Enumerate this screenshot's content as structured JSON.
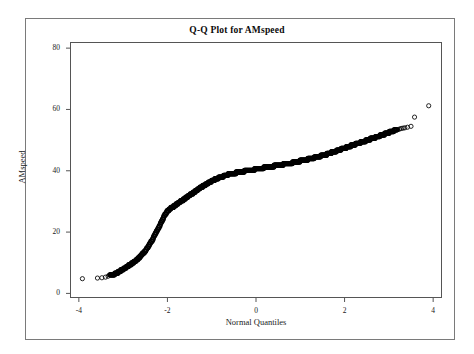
{
  "figure": {
    "title": "Q-Q Plot for AMspeed",
    "background_color": "#ffffff",
    "frame_color": "#7a7a7a",
    "axis_color": "#555555",
    "marker_color": "#000000"
  },
  "axes": {
    "x": {
      "label": "Normal Quantiles",
      "ticks": [
        "-4",
        "-2",
        "0",
        "2",
        "4"
      ],
      "tick_values": [
        -4,
        -2,
        0,
        2,
        4
      ],
      "range": [
        -4.2,
        4.2
      ]
    },
    "y": {
      "label": "AMspeed",
      "ticks": [
        "0",
        "20",
        "40",
        "60",
        "80"
      ],
      "tick_values": [
        0,
        20,
        40,
        60,
        80
      ],
      "range": [
        -1.5,
        82
      ]
    }
  },
  "chart_data": {
    "type": "scatter",
    "title": "Q-Q Plot for AMspeed",
    "xlabel": "Normal Quantiles",
    "ylabel": "AMspeed",
    "xlim": [
      -4.2,
      4.2
    ],
    "ylim": [
      -1.5,
      82
    ],
    "grid": false,
    "legend": null,
    "marker": "open-circle",
    "series": [
      {
        "name": "AMspeed sample quantiles",
        "x": [
          -3.92,
          -3.58,
          -3.48,
          -3.4,
          -3.34,
          -3.29,
          -3.24,
          -3.19,
          -3.15,
          -3.11,
          -3.07,
          -3.03,
          -3.0,
          -2.96,
          -2.93,
          -2.9,
          -2.87,
          -2.84,
          -2.81,
          -2.78,
          -2.75,
          -2.72,
          -2.7,
          -2.67,
          -2.64,
          -2.62,
          -2.59,
          -2.57,
          -2.54,
          -2.52,
          -2.49,
          -2.47,
          -2.45,
          -2.42,
          -2.4,
          -2.38,
          -2.35,
          -2.33,
          -2.31,
          -2.29,
          -2.27,
          -2.24,
          -2.22,
          -2.2,
          -2.18,
          -2.16,
          -2.14,
          -2.12,
          -2.1,
          -2.08,
          -2.06,
          -2.04,
          -2.02,
          -2.0,
          -1.98,
          -1.96,
          -1.94,
          -1.92,
          -1.9,
          -1.88,
          -1.86,
          -1.84,
          -1.82,
          -1.8,
          -1.78,
          -1.76,
          -1.74,
          -1.72,
          -1.7,
          -1.68,
          -1.66,
          -1.64,
          -1.62,
          -1.6,
          -1.58,
          -1.56,
          -1.54,
          -1.52,
          -1.5,
          -1.48,
          -1.46,
          -1.44,
          -1.42,
          -1.4,
          -1.38,
          -1.36,
          -1.34,
          -1.32,
          -1.3,
          -1.28,
          -1.26,
          -1.24,
          -1.22,
          -1.2,
          -1.18,
          -1.16,
          -1.14,
          -1.12,
          -1.1,
          -1.08,
          -1.06,
          -1.04,
          -1.02,
          -1.0,
          -0.98,
          -0.96,
          -0.94,
          -0.92,
          -0.9,
          -0.88,
          -0.86,
          -0.84,
          -0.82,
          -0.8,
          -0.78,
          -0.76,
          -0.74,
          -0.72,
          -0.7,
          -0.68,
          -0.66,
          -0.64,
          -0.62,
          -0.6,
          -0.58,
          -0.56,
          -0.54,
          -0.52,
          -0.5,
          -0.48,
          -0.46,
          -0.44,
          -0.42,
          -0.4,
          -0.38,
          -0.36,
          -0.34,
          -0.32,
          -0.3,
          -0.28,
          -0.26,
          -0.24,
          -0.22,
          -0.2,
          -0.18,
          -0.16,
          -0.14,
          -0.12,
          -0.1,
          -0.08,
          -0.06,
          -0.04,
          -0.02,
          0.0,
          0.02,
          0.04,
          0.06,
          0.08,
          0.1,
          0.12,
          0.14,
          0.16,
          0.18,
          0.2,
          0.22,
          0.24,
          0.26,
          0.28,
          0.3,
          0.32,
          0.34,
          0.36,
          0.38,
          0.4,
          0.42,
          0.44,
          0.46,
          0.48,
          0.5,
          0.52,
          0.54,
          0.56,
          0.58,
          0.6,
          0.62,
          0.64,
          0.66,
          0.68,
          0.7,
          0.72,
          0.74,
          0.76,
          0.78,
          0.8,
          0.82,
          0.84,
          0.86,
          0.88,
          0.9,
          0.92,
          0.94,
          0.96,
          0.98,
          1.0,
          1.02,
          1.04,
          1.06,
          1.08,
          1.1,
          1.12,
          1.14,
          1.16,
          1.18,
          1.2,
          1.22,
          1.24,
          1.26,
          1.28,
          1.3,
          1.32,
          1.34,
          1.36,
          1.38,
          1.4,
          1.42,
          1.44,
          1.46,
          1.48,
          1.5,
          1.52,
          1.54,
          1.56,
          1.58,
          1.6,
          1.62,
          1.64,
          1.66,
          1.68,
          1.7,
          1.72,
          1.74,
          1.76,
          1.78,
          1.8,
          1.82,
          1.84,
          1.86,
          1.88,
          1.9,
          1.92,
          1.94,
          1.96,
          1.98,
          2.0,
          2.02,
          2.04,
          2.06,
          2.08,
          2.1,
          2.13,
          2.16,
          2.19,
          2.22,
          2.25,
          2.28,
          2.31,
          2.34,
          2.37,
          2.4,
          2.43,
          2.46,
          2.49,
          2.52,
          2.55,
          2.58,
          2.61,
          2.64,
          2.67,
          2.7,
          2.73,
          2.76,
          2.79,
          2.82,
          2.85,
          2.88,
          2.91,
          2.94,
          2.97,
          3.0,
          3.04,
          3.08,
          3.12,
          3.16,
          3.2,
          3.24,
          3.28,
          3.32,
          3.36,
          3.42,
          3.5,
          3.58,
          3.9
        ],
        "y": [
          4.8,
          5.0,
          5.1,
          5.3,
          5.6,
          5.9,
          6.1,
          6.3,
          6.6,
          6.9,
          7.3,
          7.6,
          7.9,
          8.2,
          8.5,
          8.8,
          9.1,
          9.4,
          9.7,
          10.0,
          10.3,
          10.6,
          10.9,
          11.2,
          11.6,
          12.0,
          12.4,
          12.8,
          13.2,
          13.6,
          14.0,
          14.5,
          15.0,
          15.5,
          16.0,
          16.6,
          17.2,
          17.8,
          18.4,
          19.0,
          19.6,
          20.2,
          20.8,
          21.4,
          22.0,
          22.6,
          23.2,
          23.8,
          24.4,
          25.0,
          25.5,
          26.0,
          26.4,
          26.8,
          27.1,
          27.4,
          27.6,
          27.8,
          28.0,
          28.2,
          28.4,
          28.6,
          28.8,
          29.0,
          29.2,
          29.4,
          29.6,
          29.8,
          30.0,
          30.2,
          30.4,
          30.6,
          30.8,
          31.0,
          31.2,
          31.4,
          31.6,
          31.8,
          32.0,
          32.2,
          32.4,
          32.6,
          32.8,
          33.0,
          33.2,
          33.4,
          33.6,
          33.8,
          34.0,
          34.2,
          34.4,
          34.6,
          34.8,
          35.0,
          35.2,
          35.4,
          35.5,
          35.7,
          35.9,
          36.0,
          36.2,
          36.3,
          36.5,
          36.6,
          36.8,
          36.9,
          37.1,
          37.2,
          37.3,
          37.5,
          37.6,
          37.7,
          37.8,
          37.9,
          38.0,
          38.1,
          38.2,
          38.3,
          38.4,
          38.5,
          38.6,
          38.7,
          38.8,
          38.8,
          38.9,
          39.0,
          39.1,
          39.1,
          39.2,
          39.3,
          39.3,
          39.4,
          39.5,
          39.5,
          39.6,
          39.6,
          39.7,
          39.7,
          39.8,
          39.8,
          39.9,
          39.9,
          40.0,
          40.0,
          40.1,
          40.1,
          40.2,
          40.2,
          40.3,
          40.3,
          40.4,
          40.4,
          40.5,
          40.5,
          40.6,
          40.6,
          40.7,
          40.7,
          40.8,
          40.8,
          40.9,
          40.9,
          41.0,
          41.0,
          41.1,
          41.1,
          41.2,
          41.2,
          41.3,
          41.3,
          41.4,
          41.4,
          41.5,
          41.5,
          41.6,
          41.6,
          41.7,
          41.7,
          41.8,
          41.8,
          41.9,
          41.9,
          42.0,
          42.0,
          42.1,
          42.1,
          42.2,
          42.2,
          42.3,
          42.3,
          42.4,
          42.5,
          42.5,
          42.6,
          42.6,
          42.7,
          42.7,
          42.8,
          42.9,
          42.9,
          43.0,
          43.0,
          43.1,
          43.2,
          43.2,
          43.3,
          43.4,
          43.4,
          43.5,
          43.6,
          43.6,
          43.7,
          43.8,
          43.8,
          43.9,
          44.0,
          44.1,
          44.1,
          44.2,
          44.3,
          44.4,
          44.4,
          44.5,
          44.6,
          44.7,
          44.8,
          44.8,
          44.9,
          45.0,
          45.1,
          45.2,
          45.3,
          45.3,
          45.4,
          45.5,
          45.6,
          45.7,
          45.8,
          45.9,
          46.0,
          46.1,
          46.2,
          46.3,
          46.4,
          46.5,
          46.6,
          46.7,
          46.8,
          46.9,
          47.0,
          47.1,
          47.2,
          47.3,
          47.4,
          47.5,
          47.6,
          47.7,
          47.8,
          47.9,
          48.1,
          48.2,
          48.4,
          48.5,
          48.7,
          48.8,
          49.0,
          49.1,
          49.3,
          49.4,
          49.6,
          49.7,
          49.9,
          50.0,
          50.2,
          50.3,
          50.5,
          50.6,
          50.8,
          50.9,
          51.1,
          51.2,
          51.4,
          51.5,
          51.7,
          51.8,
          52.0,
          52.1,
          52.3,
          52.5,
          52.7,
          52.9,
          53.1,
          53.3,
          53.4,
          53.6,
          53.8,
          53.9,
          54.0,
          54.2,
          54.5,
          57.5,
          61.2
        ]
      }
    ]
  }
}
